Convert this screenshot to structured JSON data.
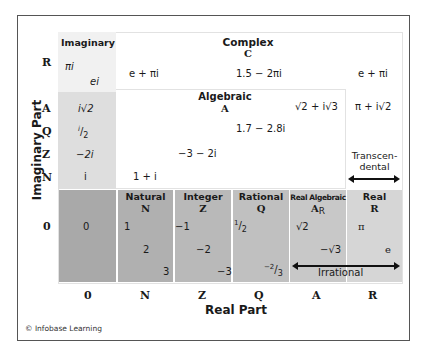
{
  "diagram": {
    "axes": {
      "x_label": "Real Part",
      "y_label": "Imaginary Part",
      "x_ticks": [
        "0",
        "N",
        "Z",
        "Q",
        "A",
        "R"
      ],
      "y_ticks": [
        "R",
        "A",
        "Q",
        "Z",
        "N",
        "0"
      ]
    },
    "regions": {
      "complex": {
        "name": "Complex",
        "symbol": "C"
      },
      "algebraic": {
        "name": "Algebraic",
        "symbol": "A"
      },
      "imaginary": {
        "name": "Imaginary"
      },
      "natural": {
        "name": "Natural",
        "symbol": "N"
      },
      "integer": {
        "name": "Integer",
        "symbol": "Z"
      },
      "rational": {
        "name": "Rational",
        "symbol": "Q"
      },
      "real_algebraic": {
        "name": "Real Algebraic",
        "symbol": "A",
        "subscript": "R"
      },
      "real": {
        "name": "Real",
        "symbol": "R"
      },
      "transcendental": {
        "name_line1": "Transcen-",
        "name_line2": "dental"
      },
      "irrational": {
        "name": "Irrational"
      }
    },
    "examples": {
      "imag_pi": "πi",
      "imag_e": "ei",
      "imag_sqrt2": "i√2",
      "imag_half_num": "i",
      "imag_half_den": "2",
      "imag_neg2": "−2i",
      "imag_i": "i",
      "complex_e_pi": "e + πi",
      "complex_1_5": "1.5 − 2πi",
      "complex_e_pi_right": "e + πi",
      "alg_sqrt": "√2 + i√3",
      "trans_pi_sqrt": "π + i√2",
      "alg_1_7": "1.7 − 2.8i",
      "alg_neg3": "−3 − 2i",
      "alg_1_i": "1 + i",
      "zero": "0",
      "nat_1": "1",
      "nat_2": "2",
      "nat_3": "3",
      "int_neg1": "−1",
      "int_neg2": "−2",
      "int_neg3": "−3",
      "rat_half_num": "1",
      "rat_half_den": "2",
      "rat_neg23_num": "−2",
      "rat_neg23_den": "3",
      "ra_sqrt2": "√2",
      "ra_negsqrt3": "−√3",
      "real_pi": "π",
      "real_e": "e"
    },
    "colors": {
      "zero_cell": "#a9a9a9",
      "natural_cell": "#b0b0b0",
      "integer_cell": "#b9b9b9",
      "rational_cell": "#c0c0c0",
      "real_alg_cell": "#c8c8c8",
      "real_cell": "#d6d6d6",
      "imag_upper": "#f1f1f1",
      "imag_lower": "#dedede"
    },
    "credit": "© Infobase Learning"
  }
}
